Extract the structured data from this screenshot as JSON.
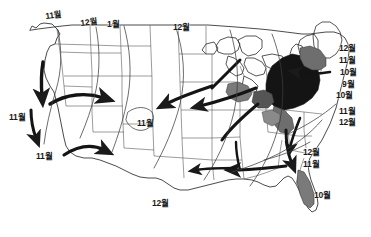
{
  "figure": {
    "background_color": "#ffffff",
    "ink_color": "#1a1a1a",
    "shade_dark": "#1c1c1c",
    "shade_mid": "#6e6e6e",
    "shade_light": "#a8a8a8"
  },
  "labels": [
    {
      "id": "nw-11",
      "text": "11월",
      "x": 46,
      "y": 12,
      "tilt": 1
    },
    {
      "id": "n-12",
      "text": "12월",
      "x": 81,
      "y": 19,
      "tilt": 1
    },
    {
      "id": "n-1",
      "text": "1월",
      "x": 107,
      "y": 20,
      "tilt": 0
    },
    {
      "id": "ncentral-12",
      "text": "12월",
      "x": 173,
      "y": 23,
      "tilt": 0
    },
    {
      "id": "w-11",
      "text": "11월",
      "x": 9,
      "y": 113,
      "tilt": 0
    },
    {
      "id": "sw-11",
      "text": "11월",
      "x": 36,
      "y": 152,
      "tilt": 0
    },
    {
      "id": "central-11",
      "text": "11월",
      "x": 137,
      "y": 119,
      "tilt": 0
    },
    {
      "id": "south-12",
      "text": "12월",
      "x": 152,
      "y": 199,
      "tilt": 0
    },
    {
      "id": "ne-12",
      "text": "12월",
      "x": 339,
      "y": 44,
      "tilt": 0
    },
    {
      "id": "ne-11",
      "text": "11월",
      "x": 339,
      "y": 56,
      "tilt": 0
    },
    {
      "id": "ne-10",
      "text": "10월",
      "x": 340,
      "y": 68,
      "tilt": 0
    },
    {
      "id": "mid-9",
      "text": "9월",
      "x": 342,
      "y": 80,
      "tilt": 0
    },
    {
      "id": "mid-10",
      "text": "10월",
      "x": 336,
      "y": 91,
      "tilt": 0
    },
    {
      "id": "se-11",
      "text": "11월",
      "x": 339,
      "y": 107,
      "tilt": 0
    },
    {
      "id": "se-12",
      "text": "12월",
      "x": 339,
      "y": 118,
      "tilt": 0
    },
    {
      "id": "gulf-12",
      "text": "12월",
      "x": 303,
      "y": 148,
      "tilt": 0
    },
    {
      "id": "gulf-11",
      "text": "11월",
      "x": 303,
      "y": 160,
      "tilt": 0
    },
    {
      "id": "florida-10",
      "text": "10월",
      "x": 314,
      "y": 191,
      "tilt": 0
    }
  ],
  "arrows": [
    {
      "id": "pacific-coast-southbound",
      "direction": "south"
    },
    {
      "id": "southwest-eastbound",
      "direction": "east"
    },
    {
      "id": "great-plains-westbound",
      "direction": "west"
    },
    {
      "id": "midwest-westbound",
      "direction": "west"
    },
    {
      "id": "great-lakes-southwest",
      "direction": "southwest"
    },
    {
      "id": "ohio-valley-southwest",
      "direction": "southwest"
    },
    {
      "id": "atlantic-coast-southbound",
      "direction": "south"
    },
    {
      "id": "gulf-coast-westbound",
      "direction": "west"
    },
    {
      "id": "appalachian-southbound",
      "direction": "south"
    },
    {
      "id": "northeast-inbound",
      "direction": "west"
    }
  ],
  "regions": [
    {
      "id": "northeast-core-range",
      "shade": "dark"
    },
    {
      "id": "mid-atlantic-range",
      "shade": "mid"
    },
    {
      "id": "great-lakes-patch",
      "shade": "mid"
    },
    {
      "id": "florida-range",
      "shade": "mid"
    }
  ]
}
